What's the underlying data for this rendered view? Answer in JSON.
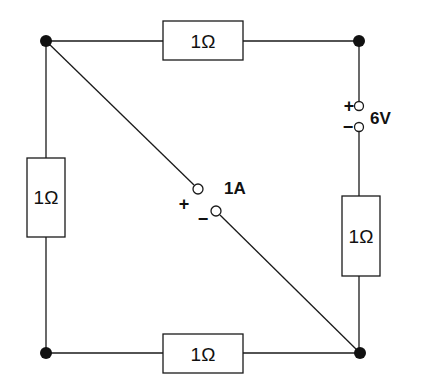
{
  "diagram": {
    "type": "electrical-circuit",
    "resistors": [
      {
        "id": "top",
        "label": "1Ω"
      },
      {
        "id": "left",
        "label": "1Ω"
      },
      {
        "id": "right",
        "label": "1Ω"
      },
      {
        "id": "bottom",
        "label": "1Ω"
      }
    ],
    "voltage_source": {
      "label": "6V",
      "plus": "+",
      "minus": "−"
    },
    "current_source": {
      "label": "1A",
      "plus": "+",
      "minus": "−"
    },
    "colors": {
      "line": "#1a1a1a",
      "background": "#ffffff"
    }
  }
}
